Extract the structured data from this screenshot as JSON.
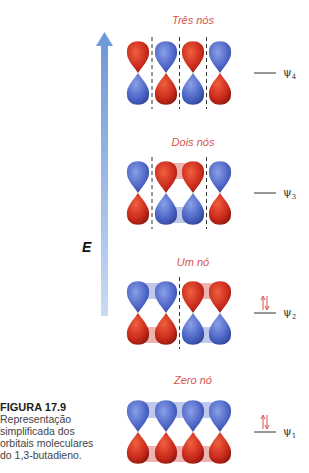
{
  "figure": {
    "label": "FIGURA 17.9",
    "caption_lines": [
      "Representação",
      "simplificada dos",
      "orbitais moleculares",
      "do 1,3-butadieno."
    ]
  },
  "axis": {
    "label": "E",
    "color": "#6f9ad8"
  },
  "colors": {
    "positive": "#cc2b1c",
    "negative": "#4a63c4",
    "title": "#d9534f"
  },
  "orbitals": [
    {
      "name": "ψ4",
      "psi": "ψ",
      "sub": "4",
      "title": "Três nós",
      "nodes": 3,
      "electrons": 0,
      "top_signs": [
        "+",
        "-",
        "+",
        "-"
      ]
    },
    {
      "name": "ψ3",
      "psi": "ψ",
      "sub": "3",
      "title": "Dois nós",
      "nodes": 2,
      "electrons": 0,
      "top_signs": [
        "-",
        "+",
        "+",
        "-"
      ]
    },
    {
      "name": "ψ2",
      "psi": "ψ",
      "sub": "2",
      "title": "Um nó",
      "nodes": 1,
      "electrons": 2,
      "top_signs": [
        "-",
        "-",
        "+",
        "+"
      ]
    },
    {
      "name": "ψ1",
      "psi": "ψ",
      "sub": "1",
      "title": "Zero nó",
      "nodes": 0,
      "electrons": 2,
      "top_signs": [
        "-",
        "-",
        "-",
        "-"
      ]
    }
  ]
}
